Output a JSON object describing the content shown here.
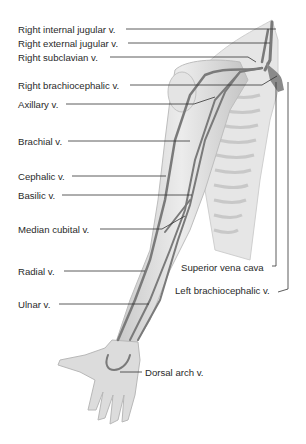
{
  "figure": {
    "labels": {
      "right_internal_jugular": "Right internal jugular v.",
      "right_external_jugular": "Right external jugular v.",
      "right_subclavian": "Right subclavian v.",
      "right_brachiocephalic": "Right brachiocephalic v.",
      "axillary": "Axillary v.",
      "brachial": "Brachial v.",
      "cephalic": "Cephalic v.",
      "basilic": "Basilic v.",
      "median_cubital": "Median cubital v.",
      "radial": "Radial v.",
      "ulnar": "Ulnar v.",
      "superior_vena_cava": "Superior vena cava",
      "left_brachiocephalic": "Left brachiocephalic v.",
      "dorsal_arch": "Dorsal arch v."
    },
    "colors": {
      "background": "#ffffff",
      "skin": "#d9d9d9",
      "vein": "#7a7a7a",
      "leader": "#333333",
      "text": "#2a2a2a"
    }
  }
}
